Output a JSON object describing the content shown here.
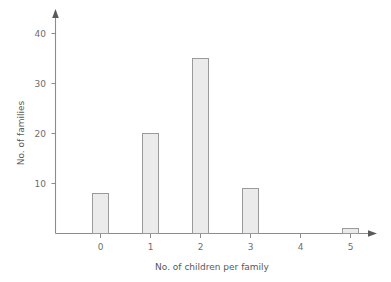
{
  "chart_data": {
    "type": "bar",
    "title": "",
    "categories": [
      "0",
      "1",
      "2",
      "3",
      "4",
      "5"
    ],
    "values": [
      8,
      20,
      35,
      9,
      0,
      1
    ],
    "series": [
      {
        "name": "No. of families",
        "values": [
          8,
          20,
          35,
          9,
          0,
          1
        ]
      }
    ],
    "xlabel": "No. of children per family",
    "ylabel": "No. of families",
    "ylim": [
      0,
      42
    ],
    "xlim": [
      -0.8,
      5.8
    ],
    "yticks": [
      10,
      20,
      30,
      40
    ],
    "ytick_labels": [
      "10",
      "20",
      "30",
      "40"
    ],
    "xtick_labels": [
      "0",
      "1",
      "2",
      "3",
      "4",
      "5"
    ],
    "grid": false,
    "legend": false,
    "legend_position": "none",
    "bar_fill_color": "#ebebeb",
    "bar_border_color": "#9a9a9a",
    "axis_color": "#8c8c8c",
    "text_color": "#6e6e6e",
    "background_color": "#ffffff",
    "axis_arrows": true
  },
  "axes": {
    "y_title": "No. of families",
    "x_title": "No. of children per family",
    "y_ticks": [
      {
        "label": "10",
        "value": 10
      },
      {
        "label": "20",
        "value": 20
      },
      {
        "label": "30",
        "value": 30
      },
      {
        "label": "40",
        "value": 40
      }
    ],
    "x_ticks": [
      {
        "label": "0",
        "value": 0
      },
      {
        "label": "1",
        "value": 1
      },
      {
        "label": "2",
        "value": 2
      },
      {
        "label": "3",
        "value": 3
      },
      {
        "label": "4",
        "value": 4
      },
      {
        "label": "5",
        "value": 5
      }
    ]
  }
}
